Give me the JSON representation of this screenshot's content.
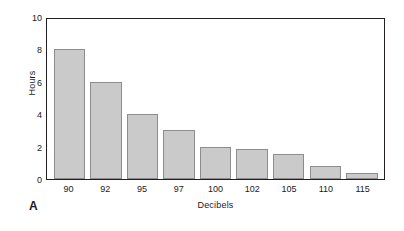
{
  "chart_data": {
    "type": "bar",
    "title": "",
    "panel_label": "A",
    "xlabel": "Decibels",
    "ylabel": "Hours",
    "categories": [
      "90",
      "92",
      "95",
      "97",
      "100",
      "102",
      "105",
      "110",
      "115"
    ],
    "values": [
      8,
      6,
      4,
      3,
      2,
      1.85,
      1.55,
      0.8,
      0.35
    ],
    "ylim": [
      0,
      10
    ],
    "yticks": [
      0,
      2,
      4,
      6,
      8,
      10
    ],
    "ytick_labels": [
      "0",
      "2",
      "4",
      "6",
      "8",
      "10"
    ],
    "grid": false,
    "legend": null,
    "bar_fill_color": "#cacaca",
    "bar_edge_color": "#8d8d8d",
    "frame_color": "#231f20",
    "background_color": "#ffffff"
  }
}
